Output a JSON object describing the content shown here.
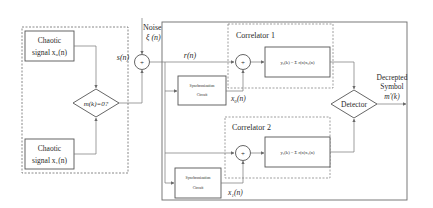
{
  "colors": {
    "stroke": "#5a5a5a",
    "text": "#2a2a2a",
    "background": "#ffffff"
  },
  "transmitter": {
    "source0": {
      "line1": "Chaotic",
      "line2": "signal x₀(n)"
    },
    "source1": {
      "line1": "Chaotic",
      "line2": "signal x₁(n)"
    },
    "switch": {
      "label": "m(k)=0?"
    },
    "output_label": "s(n)"
  },
  "channel": {
    "noise_line1": "Noise",
    "noise_line2": "ξ (n)",
    "adder_symbol": "+"
  },
  "receiver": {
    "received_label": "r(n)",
    "correlator1": {
      "title": "Correlator 1",
      "adder_symbol": "+",
      "formula": "y₀(k) = Σ r(n)x₀(n)",
      "sync": {
        "line1": "Synchronization",
        "line2": "Circuit"
      },
      "ref_label": "x₀(n)"
    },
    "correlator2": {
      "title": "Correlator 2",
      "adder_symbol": "+",
      "formula": "y₁(k) = Σ r(n)x₁(n)",
      "sync": {
        "line1": "Synchronization",
        "line2": "Circuit"
      },
      "ref_label": "x₁(n)"
    },
    "detector": {
      "label": "Detector"
    },
    "output": {
      "line1": "Decrepted",
      "line2": "Symbol",
      "line3": "m'(k)"
    }
  }
}
